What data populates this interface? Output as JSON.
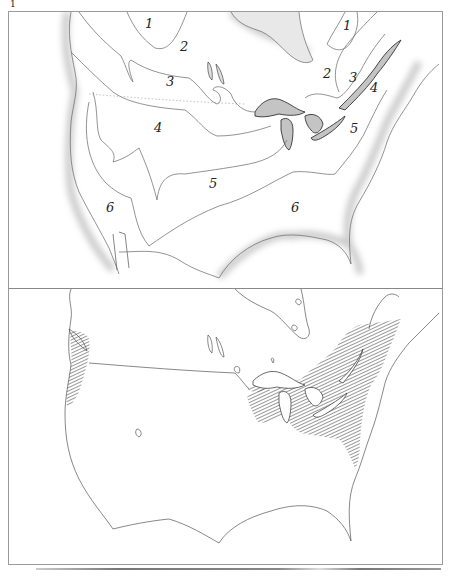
{
  "figure": {
    "marker": "1"
  },
  "top_map": {
    "title": "Zone map (numbered climatic/hardiness zones)",
    "zone_labels": [
      {
        "label": "1",
        "x": 136,
        "y": 15
      },
      {
        "label": "2",
        "x": 171,
        "y": 37
      },
      {
        "label": "3",
        "x": 157,
        "y": 70
      },
      {
        "label": "4",
        "x": 145,
        "y": 115
      },
      {
        "label": "6",
        "x": 97,
        "y": 192
      },
      {
        "label": "5",
        "x": 200,
        "y": 165
      },
      {
        "label": "6",
        "x": 282,
        "y": 192
      },
      {
        "label": "1",
        "x": 334,
        "y": 15
      },
      {
        "label": "2",
        "x": 314,
        "y": 55
      },
      {
        "label": "3",
        "x": 340,
        "y": 58
      },
      {
        "label": "4",
        "x": 361,
        "y": 70
      },
      {
        "label": "5",
        "x": 341,
        "y": 112
      }
    ],
    "colors": {
      "outline": "#555555",
      "coast_stipple": "#9a9a9a",
      "lake_fill": "#bdbdbd"
    }
  },
  "bottom_map": {
    "title": "Distribution map (hatched range)",
    "hatched_regions": [
      "Pacific Northwest coast",
      "Eastern United States and southeastern Canada"
    ],
    "colors": {
      "outline": "#444444",
      "hatch": "#555555"
    }
  }
}
